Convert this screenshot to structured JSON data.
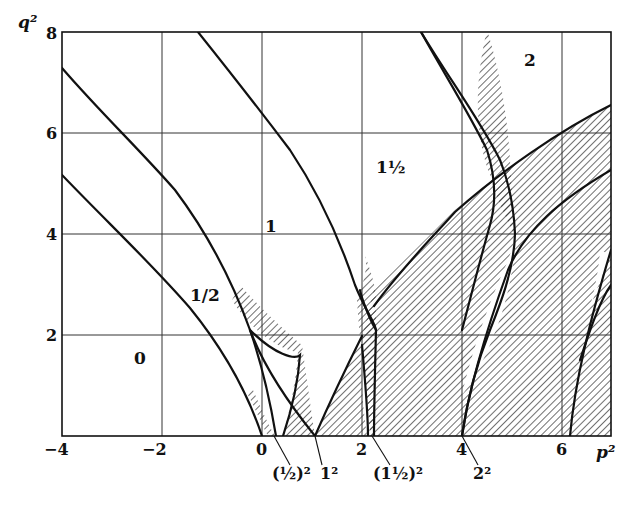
{
  "figure": {
    "type": "stability-chart",
    "x_axis": {
      "title": "p²",
      "ticks": [
        "−4",
        "−2",
        "0",
        "2",
        "4",
        "6"
      ],
      "range": [
        -4,
        7
      ]
    },
    "y_axis": {
      "title": "q²",
      "ticks": [
        "8",
        "6",
        "4",
        "2"
      ],
      "range": [
        0,
        8
      ]
    },
    "region_labels": {
      "r0": "0",
      "r_half": "1/2",
      "r1": "1",
      "r1_5": "1½",
      "r2": "2"
    },
    "axis_markers": {
      "m_half": "(½)²",
      "m1": "1²",
      "m1_5": "(1½)²",
      "m2": "2²"
    },
    "colors": {
      "ink": "#111111",
      "grid": "#333333",
      "background": "#ffffff"
    }
  }
}
